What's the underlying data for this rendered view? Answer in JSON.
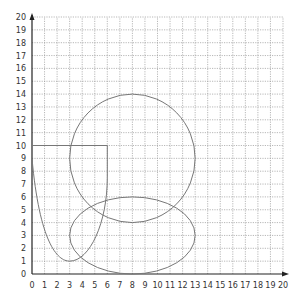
{
  "chart_data": {
    "type": "diagram",
    "title": "",
    "xlabel": "",
    "ylabel": "",
    "xlim": [
      0,
      20
    ],
    "ylim": [
      0,
      20
    ],
    "grid": "dotted",
    "x_ticks": [
      "0",
      "1",
      "2",
      "3",
      "4",
      "5",
      "6",
      "7",
      "8",
      "9",
      "10",
      "11",
      "12",
      "13",
      "14",
      "15",
      "16",
      "17",
      "18",
      "19",
      "20"
    ],
    "y_ticks": [
      "0",
      "1",
      "2",
      "3",
      "4",
      "5",
      "6",
      "7",
      "8",
      "9",
      "10",
      "11",
      "12",
      "13",
      "14",
      "15",
      "16",
      "17",
      "18",
      "19",
      "20"
    ],
    "shapes": [
      {
        "name": "circle",
        "cx": 8,
        "cy": 9,
        "r": 5
      },
      {
        "name": "ellipse",
        "cx": 8,
        "cy": 3,
        "rx": 5,
        "ry": 3
      },
      {
        "name": "u-curve",
        "points": [
          [
            0,
            9
          ],
          [
            3,
            1
          ],
          [
            6,
            7
          ],
          [
            6,
            10
          ]
        ]
      },
      {
        "name": "horizontal-line",
        "from": [
          0,
          10
        ],
        "to": [
          6,
          10
        ]
      }
    ]
  },
  "colors": {
    "axis": "#222222",
    "grid": "#9a9a9a",
    "shape": "#777777"
  }
}
